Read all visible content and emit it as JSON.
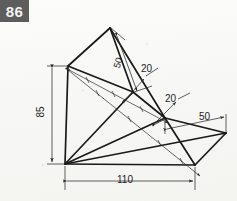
{
  "page": {
    "exercise_number": "86",
    "background_color": "#f7f7f5",
    "line_color": "#1a1a1a",
    "dimension_color": "#2b2b2b"
  },
  "drawing": {
    "title": "86",
    "type": "axonometric-engineering-drawing",
    "dimensions": [
      {
        "name": "height-85",
        "value": "85",
        "orientation": "vertical",
        "position": "left"
      },
      {
        "name": "width-110",
        "value": "110",
        "orientation": "horizontal",
        "position": "bottom"
      },
      {
        "name": "apex-edge-50",
        "value": "50",
        "orientation": "diagonal",
        "position": "apex"
      },
      {
        "name": "upper-facet-20",
        "value": "20",
        "orientation": "diagonal",
        "position": "upper-right"
      },
      {
        "name": "middle-facet-20",
        "value": "20",
        "orientation": "diagonal",
        "position": "middle-right"
      },
      {
        "name": "right-edge-50",
        "value": "50",
        "orientation": "horizontal",
        "position": "right"
      }
    ],
    "labels": {
      "height": "85",
      "width": "110",
      "apex": "50",
      "upper": "20",
      "middle": "20",
      "right": "50"
    },
    "vertices": {
      "origin": [
        65,
        164
      ],
      "top_left": [
        68,
        66
      ],
      "apex": [
        110,
        28
      ],
      "mid_upper": [
        133,
        92
      ],
      "mid_lower": [
        165,
        118
      ],
      "right": [
        226,
        133
      ],
      "bottom_right": [
        195,
        165
      ]
    }
  }
}
